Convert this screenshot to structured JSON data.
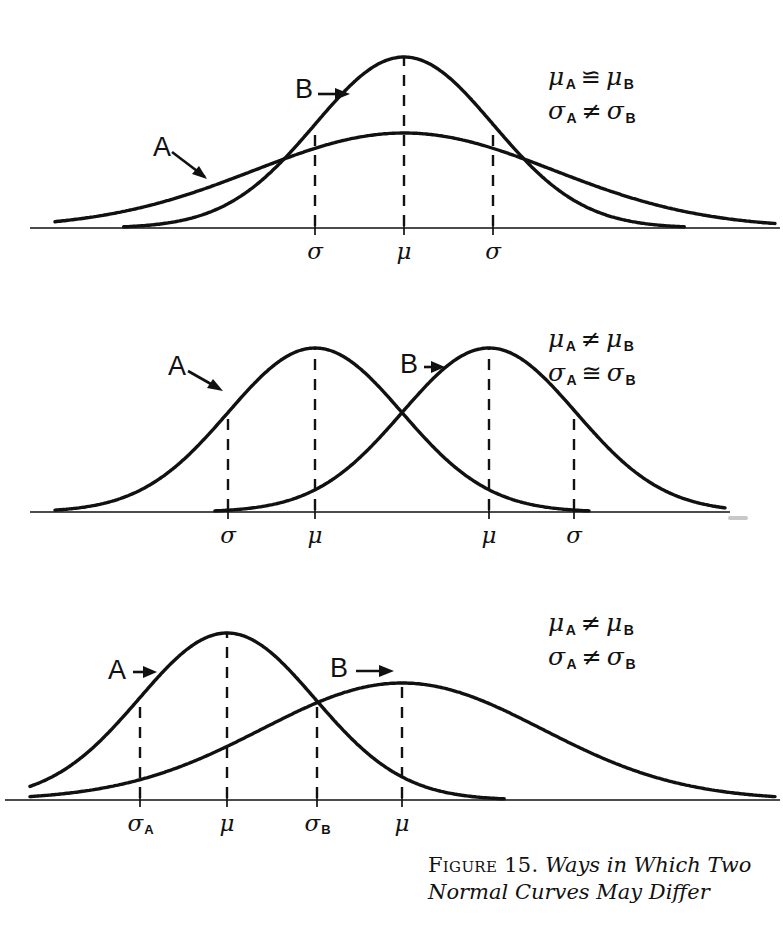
{
  "figure": {
    "caption_label": "Figure 15.",
    "caption_text": "Ways in Which Two Normal Curves May Differ"
  },
  "panels": [
    {
      "id": "panel-1",
      "curve_labels": {
        "a": "A",
        "b": "B"
      },
      "relations": {
        "mean_left": "μ",
        "mean_left_sub": "A",
        "mean_op": "≌",
        "mean_right": "μ",
        "mean_right_sub": "B",
        "sd_left": "σ",
        "sd_left_sub": "A",
        "sd_op": "≠",
        "sd_right": "σ",
        "sd_right_sub": "B"
      },
      "axis_ticks": [
        {
          "label": "σ",
          "sub": ""
        },
        {
          "label": "μ",
          "sub": ""
        },
        {
          "label": "σ",
          "sub": ""
        }
      ]
    },
    {
      "id": "panel-2",
      "curve_labels": {
        "a": "A",
        "b": "B"
      },
      "relations": {
        "mean_left": "μ",
        "mean_left_sub": "A",
        "mean_op": "≠",
        "mean_right": "μ",
        "mean_right_sub": "B",
        "sd_left": "σ",
        "sd_left_sub": "A",
        "sd_op": "≅",
        "sd_right": "σ",
        "sd_right_sub": "B"
      },
      "axis_ticks": [
        {
          "label": "σ",
          "sub": ""
        },
        {
          "label": "μ",
          "sub": ""
        },
        {
          "label": "μ",
          "sub": ""
        },
        {
          "label": "σ",
          "sub": ""
        }
      ]
    },
    {
      "id": "panel-3",
      "curve_labels": {
        "a": "A",
        "b": "B"
      },
      "relations": {
        "mean_left": "μ",
        "mean_left_sub": "A",
        "mean_op": "≠",
        "mean_right": "μ",
        "mean_right_sub": "B",
        "sd_left": "σ",
        "sd_left_sub": "A",
        "sd_op": "≠",
        "sd_right": "σ",
        "sd_right_sub": "B"
      },
      "axis_ticks": [
        {
          "label": "σ",
          "sub": "A"
        },
        {
          "label": "μ",
          "sub": ""
        },
        {
          "label": "σ",
          "sub": "B"
        },
        {
          "label": "μ",
          "sub": ""
        }
      ]
    }
  ],
  "chart_data": {
    "type": "line",
    "title": "Ways in Which Two Normal Curves May Differ",
    "xlabel": "",
    "ylabel": "",
    "grid": false,
    "legend": "inline-curve-tags",
    "panels": [
      {
        "name": "Equal means, unequal standard deviations",
        "relation_mu": "μ_A ≌ μ_B",
        "relation_sigma": "σ_A ≠ σ_B",
        "baseline_y_px": 228,
        "x_domain_px": [
          55,
          740
        ],
        "series": [
          {
            "name": "A",
            "mu_px": 404,
            "sigma_px": 150,
            "peak_y_px": 133,
            "amplitude_px": 95
          },
          {
            "name": "B",
            "mu_px": 404,
            "sigma_px": 89,
            "peak_y_px": 57,
            "amplitude_px": 171
          }
        ],
        "tick_positions_px": [
          315,
          404,
          493
        ],
        "tick_labels": [
          "σ",
          "μ",
          "σ"
        ]
      },
      {
        "name": "Unequal means, equal standard deviations",
        "relation_mu": "μ_A ≠ μ_B",
        "relation_sigma": "σ_A ≅ σ_B",
        "baseline_y_px": 512,
        "x_domain_px": [
          55,
          690
        ],
        "series": [
          {
            "name": "A",
            "mu_px": 315,
            "sigma_px": 87,
            "peak_y_px": 348,
            "amplitude_px": 164
          },
          {
            "name": "B",
            "mu_px": 489,
            "sigma_px": 87,
            "peak_y_px": 348,
            "amplitude_px": 164
          }
        ],
        "tick_positions_px": [
          228,
          315,
          489,
          574
        ],
        "tick_labels": [
          "σ",
          "μ",
          "μ",
          "σ"
        ]
      },
      {
        "name": "Unequal means, unequal standard deviations",
        "relation_mu": "μ_A ≠ μ_B",
        "relation_sigma": "σ_A ≠ σ_B",
        "baseline_y_px": 800,
        "x_domain_px": [
          30,
          740
        ],
        "series": [
          {
            "name": "A",
            "mu_px": 227,
            "sigma_px": 88,
            "peak_y_px": 633,
            "amplitude_px": 167
          },
          {
            "name": "B",
            "mu_px": 402,
            "sigma_px": 140,
            "peak_y_px": 683,
            "amplitude_px": 117
          }
        ],
        "tick_positions_px": [
          140,
          227,
          317,
          402
        ],
        "tick_labels": [
          "σ_A",
          "μ",
          "σ_B",
          "μ"
        ]
      }
    ]
  }
}
